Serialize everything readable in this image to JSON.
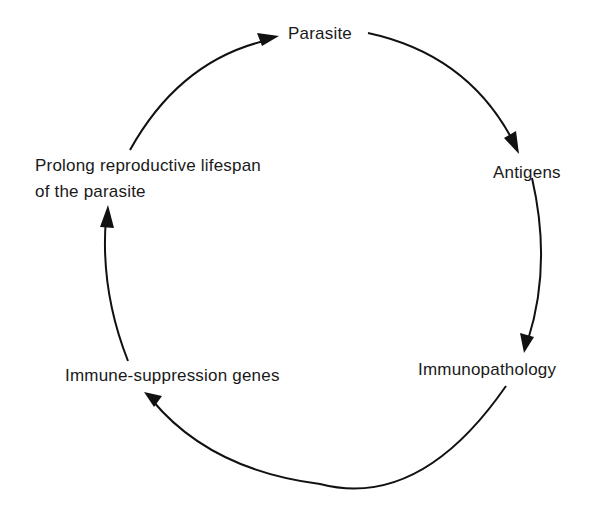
{
  "diagram": {
    "type": "cycle",
    "nodes": [
      {
        "id": "parasite",
        "label": "Parasite"
      },
      {
        "id": "antigens",
        "label": "Antigens"
      },
      {
        "id": "immunopathology",
        "label": "Immunopathology"
      },
      {
        "id": "immune_suppression",
        "label": "Immune-suppression genes"
      },
      {
        "id": "prolong",
        "label_line1": "Prolong reproductive lifespan",
        "label_line2": "of the parasite"
      }
    ],
    "edges": [
      {
        "from": "parasite",
        "to": "antigens"
      },
      {
        "from": "antigens",
        "to": "immunopathology"
      },
      {
        "from": "immunopathology",
        "to": "immune_suppression"
      },
      {
        "from": "immune_suppression",
        "to": "prolong"
      },
      {
        "from": "prolong",
        "to": "parasite"
      }
    ],
    "colors": {
      "line": "#111111",
      "text": "#1a1a1a",
      "background": "#ffffff"
    }
  }
}
